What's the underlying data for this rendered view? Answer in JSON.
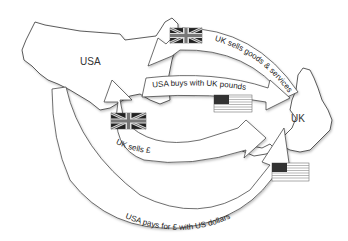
{
  "diagram": {
    "countries": [
      {
        "id": "usa",
        "label": "USA"
      },
      {
        "id": "uk",
        "label": "UK"
      }
    ],
    "flows": [
      {
        "id": "uk-sells-goods",
        "label": "UK sells goods & services",
        "from": "UK",
        "to": "USA",
        "flag": "union-jack"
      },
      {
        "id": "usa-buys-pounds",
        "label": "USA buys with UK pounds",
        "from": "USA",
        "to": "UK",
        "flag": "us-flag"
      },
      {
        "id": "uk-sells-pound",
        "label": "UK sells £",
        "from": "USA",
        "to": "UK",
        "flag": "union-jack"
      },
      {
        "id": "usa-pays-dollars",
        "label": "USA pays for £ with US dollars",
        "from": "USA",
        "to": "UK",
        "flag": "us-flag"
      }
    ],
    "colors": {
      "outline": "#333333",
      "arrow_fill": "#ffffff",
      "flag_dark": "#222222",
      "flag_light": "#eeeeee"
    }
  }
}
